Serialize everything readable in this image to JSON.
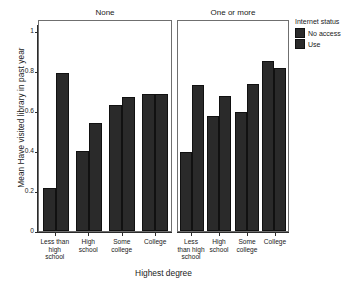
{
  "chart_data": {
    "type": "bar",
    "title": "",
    "xlabel": "Highest degree",
    "ylabel": "Mean Have visited library in past year",
    "ylim": [
      0,
      1.03
    ],
    "yticks": [
      "0",
      "0.2",
      "0.4",
      "0.6",
      "0.8",
      "1"
    ],
    "ytick_values": [
      0,
      0.2,
      0.4,
      0.6,
      0.8,
      1
    ],
    "grid": false,
    "legend_position": "right",
    "legend_title": "Internet status",
    "categories": [
      "Less than high school",
      "High school",
      "Some college",
      "College"
    ],
    "panels": [
      {
        "label": "None",
        "series": [
          {
            "name": "No access",
            "values": [
              0.215,
              0.4,
              0.63,
              0.685
            ]
          },
          {
            "name": "Use",
            "values": [
              0.79,
              0.54,
              0.67,
              0.685
            ]
          }
        ]
      },
      {
        "label": "One or more",
        "series": [
          {
            "name": "No access",
            "values": [
              0.395,
              0.575,
              0.595,
              0.85
            ]
          },
          {
            "name": "Use",
            "values": [
              0.73,
              0.675,
              0.735,
              0.815
            ]
          }
        ]
      }
    ],
    "series_colors": [
      "#2a2a2a",
      "#2a2a2a"
    ]
  },
  "axes": {
    "y_title": "Mean Have visited library in past year",
    "x_title": "Highest degree",
    "y_ticks": [
      {
        "label": "1"
      },
      {
        "label": "0.8"
      },
      {
        "label": "0.6"
      },
      {
        "label": "0.4"
      },
      {
        "label": "0.2"
      },
      {
        "label": "0"
      }
    ]
  },
  "panels": {
    "none": {
      "title": "None",
      "x_labels": [
        "Less than high school",
        "High school",
        "Some college",
        "College"
      ]
    },
    "onemore": {
      "title": "One or more",
      "x_labels": [
        "Less than high school",
        "High school",
        "Some college",
        "College"
      ]
    }
  },
  "legend": {
    "title": "Internet status",
    "items": [
      {
        "label": "No access",
        "color": "#2a2a2a"
      },
      {
        "label": "Use",
        "color": "#2a2a2a"
      }
    ]
  }
}
